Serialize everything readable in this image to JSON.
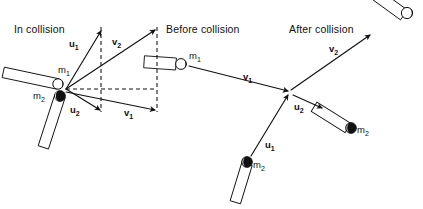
{
  "figure": {
    "width": 423,
    "height": 209,
    "background_color": "#ffffff",
    "ink_color": "#111111"
  },
  "panels": [
    {
      "id": "in-collision",
      "title": "In collision",
      "title_x": 14,
      "title_y": 33
    },
    {
      "id": "before-collision",
      "title": "Before collision",
      "title_x": 166,
      "title_y": 33
    },
    {
      "id": "after-collision",
      "title": "After collision",
      "title_x": 289,
      "title_y": 33
    }
  ],
  "vector_labels": {
    "u1": {
      "base": "u",
      "sub": "1"
    },
    "u2": {
      "base": "u",
      "sub": "2"
    },
    "v1": {
      "base": "v",
      "sub": "1"
    },
    "v2": {
      "base": "v",
      "sub": "2"
    }
  },
  "mass_labels": {
    "m1": {
      "base": "m",
      "sub": "1"
    },
    "m2": {
      "base": "m",
      "sub": "2"
    }
  },
  "left_panel": {
    "origin": {
      "x": 66,
      "y": 89
    },
    "vectors": [
      {
        "name": "u1",
        "label": "u",
        "sub": "1",
        "to_x": 101,
        "to_y": 31,
        "label_x": 72,
        "label_y": 46
      },
      {
        "name": "v2",
        "label": "v",
        "sub": "2",
        "to_x": 155,
        "to_y": 30,
        "label_x": 114,
        "label_y": 45
      },
      {
        "name": "u2",
        "label": "u",
        "sub": "2",
        "to_x": 101,
        "to_y": 110,
        "label_x": 72,
        "label_y": 110
      },
      {
        "name": "v1",
        "label": "v",
        "sub": "1",
        "to_x": 155,
        "to_y": 110,
        "label_x": 126,
        "label_y": 113
      }
    ],
    "construction_lines": [
      {
        "name": "horizontal-dashed",
        "x1": 66,
        "y1": 89,
        "x2": 157,
        "y2": 89
      },
      {
        "name": "vertical-dashed-inner",
        "x1": 101,
        "y1": 28,
        "x2": 101,
        "y2": 112
      },
      {
        "name": "vertical-dashed-outer",
        "x1": 157,
        "y1": 28,
        "x2": 157,
        "y2": 112
      }
    ],
    "bodies": [
      {
        "name": "m1",
        "label": "m",
        "sub": "1",
        "ball_x": 58,
        "ball_y": 84,
        "ball_r": 5.2,
        "ball_style": "light",
        "label_x": 60,
        "label_y": 73,
        "rod_angle_deg": 200,
        "rod_length": 58,
        "rod_width": 11
      },
      {
        "name": "m2",
        "label": "m",
        "sub": "2",
        "ball_x": 60,
        "ball_y": 96,
        "ball_r": 5.4,
        "ball_style": "dark",
        "label_x": 34,
        "label_y": 99,
        "rod_angle_deg": 110,
        "rod_length": 56,
        "rod_width": 11
      }
    ]
  },
  "middle_panel": {
    "body": {
      "name": "m1",
      "label": "m",
      "sub": "1",
      "ball_x": 181,
      "ball_y": 64,
      "ball_r": 5.4,
      "ball_style": "light",
      "label_x": 190,
      "label_y": 59,
      "rod_angle_deg": 186,
      "rod_length": 33,
      "rod_width": 12
    },
    "vector": {
      "name": "v1",
      "label": "v",
      "sub": "1",
      "from_x": 188,
      "from_y": 65,
      "to_x": 288,
      "to_y": 91,
      "label_x": 245,
      "label_y": 78
    },
    "body2": {
      "name": "m2",
      "label": "m",
      "sub": "2",
      "ball_x": 247,
      "ball_y": 163,
      "ball_r": 5.4,
      "ball_style": "dark",
      "label_x": 254,
      "label_y": 169,
      "rod_angle_deg": 110,
      "rod_length": 40,
      "rod_width": 11
    },
    "vector2": {
      "name": "u1",
      "label": "u",
      "sub": "1",
      "from_x": 250,
      "from_y": 158,
      "to_x": 287,
      "to_y": 94,
      "label_x": 266,
      "label_y": 146
    },
    "collision_point": {
      "x": 289,
      "y": 91
    }
  },
  "right_panel": {
    "body": {
      "name": "m2",
      "label": "m",
      "sub": "2",
      "ball_x": 350,
      "ball_y": 128,
      "ball_r": 5.4,
      "ball_style": "dark",
      "label_x": 358,
      "label_y": 133,
      "rod_angle_deg": 215,
      "rod_length": 40,
      "rod_width": 11
    },
    "vector_u2": {
      "name": "u2",
      "label": "u",
      "sub": "2",
      "from_x": 292,
      "from_y": 94,
      "to_x": 323,
      "to_y": 108,
      "label_x": 296,
      "label_y": 109
    },
    "body_v2": {
      "name": "v2-rod",
      "ball_x": 407,
      "ball_y": 13,
      "ball_r": 5.6,
      "ball_style": "light",
      "rod_angle_deg": 215,
      "rod_length": 42,
      "rod_width": 12
    },
    "vector_v2": {
      "name": "v2",
      "label": "v",
      "sub": "2",
      "from_x": 290,
      "from_y": 89,
      "to_x": 372,
      "to_y": 34,
      "label_x": 331,
      "label_y": 50
    }
  }
}
